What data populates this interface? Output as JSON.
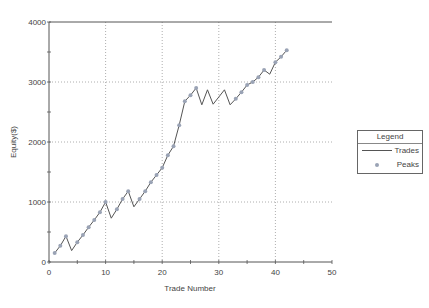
{
  "chart_data": {
    "type": "line",
    "title": "",
    "xlabel": "Trade Number",
    "ylabel": "Equity($)",
    "xlim": [
      0,
      50
    ],
    "ylim": [
      0,
      4000
    ],
    "xticks": [
      0,
      10,
      20,
      30,
      40,
      50
    ],
    "yticks": [
      0,
      1000,
      2000,
      3000,
      4000
    ],
    "grid": true,
    "legend": {
      "title": "Legend",
      "position": "right",
      "entries": [
        "Trades",
        "Peaks"
      ]
    },
    "series": [
      {
        "name": "Trades",
        "x": [
          1,
          2,
          3,
          4,
          5,
          6,
          7,
          8,
          9,
          10,
          11,
          12,
          13,
          14,
          15,
          16,
          17,
          18,
          19,
          20,
          21,
          22,
          23,
          24,
          25,
          26,
          27,
          28,
          29,
          30,
          31,
          32,
          33,
          34,
          35,
          36,
          37,
          38,
          39,
          40,
          41,
          42
        ],
        "values": [
          150,
          270,
          430,
          190,
          330,
          450,
          580,
          700,
          830,
          1000,
          730,
          880,
          1050,
          1180,
          920,
          1050,
          1180,
          1330,
          1450,
          1570,
          1780,
          1930,
          2280,
          2680,
          2780,
          2900,
          2620,
          2870,
          2630,
          2750,
          2870,
          2620,
          2720,
          2830,
          2950,
          3000,
          3080,
          3200,
          3130,
          3330,
          3420,
          3530
        ]
      },
      {
        "name": "Peaks",
        "x": [
          1,
          2,
          3,
          5,
          6,
          7,
          8,
          9,
          10,
          12,
          13,
          14,
          16,
          17,
          18,
          19,
          20,
          21,
          22,
          23,
          24,
          25,
          26,
          33,
          34,
          35,
          36,
          37,
          38,
          40,
          41,
          42
        ],
        "values": [
          150,
          270,
          430,
          330,
          450,
          580,
          700,
          830,
          1000,
          880,
          1050,
          1180,
          1050,
          1180,
          1330,
          1450,
          1570,
          1780,
          1930,
          2280,
          2680,
          2780,
          2900,
          2720,
          2830,
          2950,
          3000,
          3080,
          3200,
          3330,
          3420,
          3530
        ]
      }
    ]
  },
  "labels": {
    "xlabel": "Trade Number",
    "ylabel": "Equity($)",
    "xticks": [
      "0",
      "10",
      "20",
      "30",
      "40",
      "50"
    ],
    "yticks": [
      "0",
      "1000",
      "2000",
      "3000",
      "4000"
    ]
  },
  "legend": {
    "title": "Legend",
    "trades_label": "Trades",
    "peaks_label": "Peaks"
  },
  "colors": {
    "line": "#555555",
    "marker": "#9aa3b5",
    "grid": "#999999",
    "axis": "#555555"
  }
}
